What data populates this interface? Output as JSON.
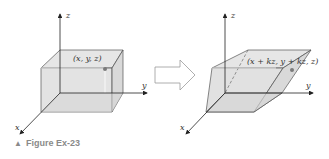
{
  "figure": {
    "caption_marker": "▲",
    "caption": "Figure Ex-23",
    "left_panel": {
      "axes": {
        "x": "x",
        "y": "y",
        "z": "z"
      },
      "point_label": "(x, y, z)"
    },
    "transform_arrow": "right-arrow",
    "right_panel": {
      "axes": {
        "x": "x",
        "y": "y",
        "z": "z"
      },
      "point_label": "(x + kz, y + kz, z)"
    },
    "colors": {
      "box_fill": "#dcdcdc",
      "edge": "#555555",
      "point": "#7a7a7a",
      "arrow_outline": "#9a9a9a",
      "caption": "#8a8a8a"
    }
  }
}
